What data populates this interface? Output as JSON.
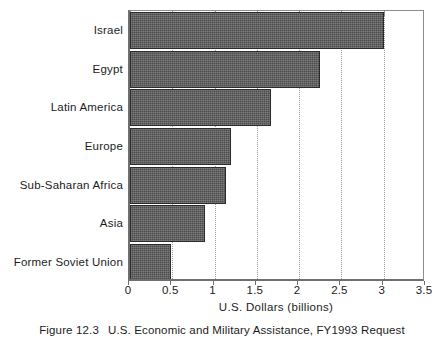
{
  "figure": {
    "caption_number": "Figure 12.3",
    "caption_text": "U.S. Economic and Military Assistance, FY1993 Request"
  },
  "chart_data": {
    "type": "bar",
    "orientation": "horizontal",
    "title": "",
    "subtitle": "",
    "xlabel": "U.S. Dollars  (billions)",
    "ylabel": "",
    "categories": [
      "Israel",
      "Egypt",
      "Latin America",
      "Europe",
      "Sub-Saharan Africa",
      "Asia",
      "Former Soviet Union"
    ],
    "values": [
      3.0,
      2.25,
      1.67,
      1.19,
      1.13,
      0.89,
      0.48
    ],
    "xlim": [
      0,
      3.5
    ],
    "xticks": [
      0,
      0.5,
      1,
      1.5,
      2,
      2.5,
      3,
      3.5
    ],
    "xtick_labels": [
      "0",
      "0.5",
      "1",
      "1.5",
      "2",
      "2.5",
      "3",
      "3.5"
    ],
    "grid": "vertical-dotted",
    "legend": "none",
    "bar_color": "#4b4b4b",
    "bar_edge_color": "#2b2b2b",
    "axis_color": "#6f6f6f",
    "grid_color": "#9a9a9a",
    "background": "#ffffff"
  }
}
